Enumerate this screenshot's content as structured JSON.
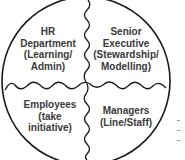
{
  "diagram": {
    "quadrants": [
      {
        "id": "top-left",
        "lines": [
          "HR",
          "Department",
          "(Learning/",
          "Admin)"
        ]
      },
      {
        "id": "top-right",
        "lines": [
          "Senior",
          "Executive",
          "(Stewardship/",
          "Modelling)"
        ]
      },
      {
        "id": "bottom-left",
        "lines": [
          "Employees",
          "(take",
          "initiative)"
        ]
      },
      {
        "id": "bottom-right",
        "lines": [
          "Managers",
          "(Line/Staff)"
        ]
      }
    ],
    "colors": {
      "stroke": "#1a1a1a",
      "text": "#3a3a3a",
      "background": "#ffffff"
    }
  }
}
